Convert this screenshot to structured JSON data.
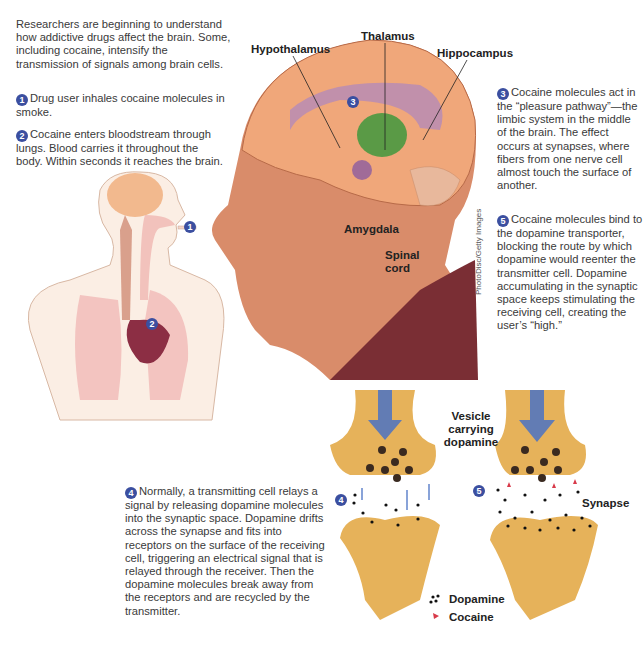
{
  "intro": "Researchers are beginning to understand how addictive drugs affect the brain. Some, including cocaine, intensify the transmission of signals among brain cells.",
  "steps": [
    {
      "num": "1",
      "text": "Drug user inhales cocaine molecules in smoke."
    },
    {
      "num": "2",
      "text": "Cocaine enters bloodstream through lungs. Blood carries it throughout the body. Within seconds it reaches the brain."
    },
    {
      "num": "3",
      "text": "Cocaine molecules act in the “pleasure pathway”—the limbic system in the middle of the brain. The effect occurs at synapses, where fibers from one nerve cell almost touch the surface of another."
    },
    {
      "num": "4",
      "text": "Normally, a transmitting cell relays a signal by releasing dopamine molecules into the synaptic space. Dopamine drifts across the synapse and fits into receptors on the surface of the receiving cell, triggering an electrical signal that is relayed through the receiver. Then the dopamine molecules break away from the receptors and are recycled by the transmitter."
    },
    {
      "num": "5",
      "text": "Cocaine molecules bind to the dopamine transporter, blocking the route by which dopamine would reenter the transmitter cell. Dopamine accumulating in the synaptic space keeps stimulating the receiving cell, creating the user’s “high.”"
    }
  ],
  "brain_labels": {
    "hypothalamus": "Hypothalamus",
    "thalamus": "Thalamus",
    "hippocampus": "Hippocampus",
    "amygdala": "Amygdala",
    "spinal_cord": "Spinal cord"
  },
  "synapse_labels": {
    "vesicle": "Vesicle carrying dopamine",
    "synapse": "Synapse"
  },
  "legend": [
    {
      "label": "Dopamine",
      "symbol": "black-dots"
    },
    {
      "label": "Cocaine",
      "symbol": "red-triangle"
    }
  ],
  "credit": "PhotoDisc/Getty Images",
  "colors": {
    "badge": "#3b4fa0",
    "neuron": "#e6b25a",
    "brain": "#f0a77a",
    "limbic": "#a9789e",
    "thalamus": "#5a9a46",
    "skin": "#d98c6a",
    "shirt": "#7a2e34",
    "arrow": "#4a72c4",
    "cocaine": "#d83a4a"
  }
}
